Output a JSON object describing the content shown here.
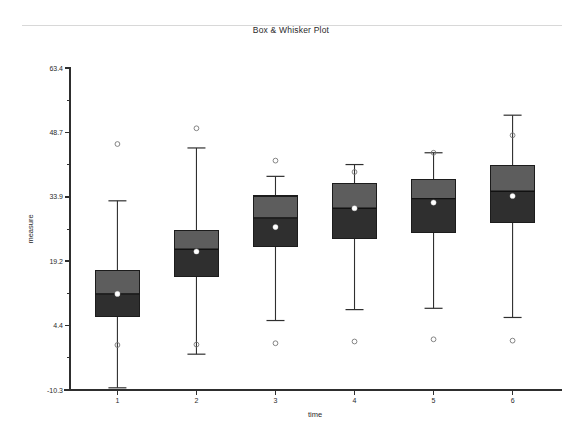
{
  "page": {
    "background_color": "#ffffff",
    "rule_color": "#d8d8d8"
  },
  "title": "Box & Whisker Plot",
  "axes": {
    "x_title": "time",
    "y_title": "measure"
  },
  "colors": {
    "box_upper_fill": "#5d5d5d",
    "box_lower_fill": "#2f2f2f",
    "box_outline": "#1c1c1c",
    "whisker": "#2f2f2f",
    "median": "#111111",
    "mean_marker": "#ffffff",
    "outlier": "#777777",
    "axis": "#2e2e2e",
    "text": "#2a2a2a"
  },
  "chart_data": {
    "type": "box",
    "title": "Box & Whisker Plot",
    "xlabel": "time",
    "ylabel": "measure",
    "grid": false,
    "legend": "none",
    "categories": [
      "1",
      "2",
      "3",
      "4",
      "5",
      "6"
    ],
    "x_tick_labels": [
      "1",
      "2",
      "3",
      "4",
      "5",
      "6"
    ],
    "y_tick_labels": [
      "63.4",
      "48.7",
      "33.9",
      "19.2",
      "4.4",
      "-10.3"
    ],
    "y_tick_values": [
      63.4,
      48.7,
      33.9,
      19.2,
      4.4,
      -10.3
    ],
    "y_minor_ticks": [
      56.05,
      41.3,
      26.55,
      11.8,
      -2.95
    ],
    "ylim": [
      -10.3,
      63.4
    ],
    "xlim": [
      0.4,
      6.6
    ],
    "boxes": [
      {
        "category": "1",
        "whisker_low": -9.8,
        "q1": 6.6,
        "median": 11.7,
        "mean": 11.7,
        "q3": 17.0,
        "whisker_high": 33.0,
        "outliers": [
          46.0,
          0.0
        ]
      },
      {
        "category": "2",
        "whisker_low": -2.1,
        "q1": 15.6,
        "median": 21.9,
        "mean": 21.4,
        "q3": 26.2,
        "whisker_high": 45.1,
        "outliers": [
          49.6,
          0.1
        ]
      },
      {
        "category": "3",
        "whisker_low": 5.6,
        "q1": 22.6,
        "median": 29.1,
        "mean": 27.0,
        "q3": 34.1,
        "whisker_high": 38.6,
        "outliers": [
          42.2,
          0.4
        ]
      },
      {
        "category": "4",
        "whisker_low": 8.1,
        "q1": 24.3,
        "median": 31.3,
        "mean": 31.3,
        "q3": 37.0,
        "whisker_high": 41.3,
        "outliers": [
          39.6,
          0.8
        ]
      },
      {
        "category": "5",
        "whisker_low": 8.4,
        "q1": 25.7,
        "median": 33.5,
        "mean": 32.6,
        "q3": 37.8,
        "whisker_high": 44.0,
        "outliers": [
          44.0,
          1.3
        ]
      },
      {
        "category": "6",
        "whisker_low": 6.3,
        "q1": 28.0,
        "median": 35.2,
        "mean": 34.1,
        "q3": 41.0,
        "whisker_high": 52.6,
        "outliers": [
          48.0,
          1.0
        ]
      }
    ]
  }
}
